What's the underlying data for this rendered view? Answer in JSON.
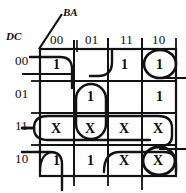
{
  "diagram": {
    "type": "karnaugh-map",
    "variable_labels": {
      "columns": "BA",
      "rows": "DC"
    },
    "column_headers": [
      "00",
      "01",
      "11",
      "10"
    ],
    "row_headers": [
      "00",
      "01",
      "11",
      "10"
    ],
    "cells": [
      {
        "row": "00",
        "col": "00",
        "value": "1"
      },
      {
        "row": "00",
        "col": "01",
        "value": ""
      },
      {
        "row": "00",
        "col": "11",
        "value": "1"
      },
      {
        "row": "00",
        "col": "10",
        "value": "1"
      },
      {
        "row": "01",
        "col": "00",
        "value": ""
      },
      {
        "row": "01",
        "col": "01",
        "value": "1"
      },
      {
        "row": "01",
        "col": "11",
        "value": ""
      },
      {
        "row": "01",
        "col": "10",
        "value": "1"
      },
      {
        "row": "11",
        "col": "00",
        "value": "X"
      },
      {
        "row": "11",
        "col": "01",
        "value": "X"
      },
      {
        "row": "11",
        "col": "11",
        "value": "X"
      },
      {
        "row": "11",
        "col": "10",
        "value": "X"
      },
      {
        "row": "10",
        "col": "00",
        "value": "1"
      },
      {
        "row": "10",
        "col": "01",
        "value": "1"
      },
      {
        "row": "10",
        "col": "11",
        "value": "X"
      },
      {
        "row": "10",
        "col": "10",
        "value": "X"
      }
    ],
    "groupings": [
      {
        "name": "corner-wrap-top-left",
        "cells": [
          "00/00"
        ]
      },
      {
        "name": "corner-wrap-bottom-left",
        "cells": [
          "10/00"
        ]
      },
      {
        "name": "circle-top-right",
        "cells": [
          "00/10"
        ]
      },
      {
        "name": "circle-bottom-right",
        "cells": [
          "10/10"
        ]
      },
      {
        "name": "vertical-pair-col01",
        "cells": [
          "01/01",
          "11/01"
        ]
      },
      {
        "name": "row-11-full-span",
        "cells": [
          "11/00",
          "11/01",
          "11/11",
          "11/10"
        ]
      },
      {
        "name": "bottom-right-pair",
        "cells": [
          "10/11",
          "10/10"
        ]
      },
      {
        "name": "col11-row00-edge",
        "cells": [
          "00/11"
        ]
      }
    ],
    "ink_color": "#121212"
  }
}
